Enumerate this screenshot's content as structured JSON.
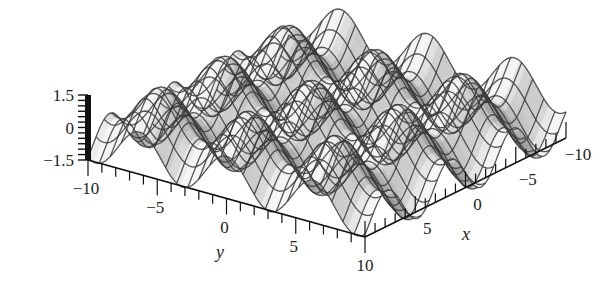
{
  "chart_data": {
    "type": "surface3d",
    "title": "",
    "function_hint": "z = sin(x) + cos(y)",
    "x": {
      "label": "x",
      "range": [
        -10,
        10
      ],
      "ticks": [
        -10,
        -5,
        0,
        5,
        10
      ],
      "tick_labels": [
        "−10",
        "−5",
        "0",
        "5",
        "10"
      ]
    },
    "y": {
      "label": "y",
      "range": [
        -10,
        10
      ],
      "ticks": [
        -10,
        -5,
        0,
        5,
        10
      ],
      "tick_labels": [
        "−10",
        "−5",
        "0",
        "5",
        "10"
      ]
    },
    "z": {
      "label": "",
      "range": [
        -1.5,
        1.5
      ],
      "ticks": [
        -1.5,
        0,
        1.5
      ],
      "tick_labels": [
        "−1.5",
        "0",
        "1.5"
      ]
    },
    "grid": {
      "mesh_lines_x": 25,
      "mesh_lines_y": 25
    },
    "colors": {
      "surface_light": "#f2f2f2",
      "surface_dark": "#6e6e6e",
      "mesh": "#3a3a3a",
      "axis": "#111111"
    },
    "legend": "none"
  },
  "labels": {
    "x_axis": "x",
    "y_axis": "y"
  }
}
